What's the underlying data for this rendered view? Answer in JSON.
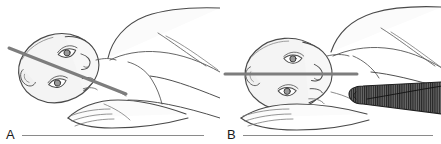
{
  "figure": {
    "type": "medical-line-illustration",
    "width": 441,
    "height": 144,
    "background_color": "#ffffff"
  },
  "panels": [
    {
      "id": "A",
      "label": "A",
      "subject": "prone-patient-head-rotated",
      "reference_line": {
        "name": "alignment-line",
        "orientation": "angled",
        "color": "#7d7d7d",
        "thickness_px": 3,
        "x1": 9,
        "y1": 48,
        "x2": 126,
        "y2": 94
      },
      "support": null,
      "caption_rule": {
        "color": "#8a8a8a",
        "width_px": 182
      }
    },
    {
      "id": "B",
      "label": "B",
      "subject": "prone-patient-head-neutral",
      "reference_line": {
        "name": "alignment-line",
        "orientation": "horizontal",
        "color": "#7d7d7d",
        "thickness_px": 3,
        "x1": 4,
        "y1": 74,
        "x2": 136,
        "y2": 74
      },
      "support": {
        "name": "shoulder-roll",
        "fill": "#5e5e5e",
        "hatch_color": "#2b2b2b",
        "hatch_direction": "vertical",
        "x": 129,
        "y": 92,
        "width": 92,
        "height": 24
      },
      "caption_rule": {
        "color": "#8a8a8a",
        "width_px": 190
      }
    }
  ],
  "colors": {
    "outline": "#4a4a4a",
    "outline_light": "#8d8d8d",
    "skin_fill": "#fbfbfb",
    "head_fill": "#f4f4f4",
    "reference_line": "#7d7d7d",
    "roll_fill": "#5e5e5e",
    "roll_hatch": "#262626",
    "label_text": "#1a1a1a",
    "rule": "#8a8a8a",
    "background": "#ffffff"
  }
}
